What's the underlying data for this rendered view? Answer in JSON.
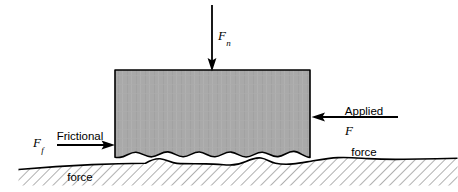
{
  "figure": {
    "name": "friction-force-diagram",
    "background_color": "#ffffff",
    "line_color": "#000000"
  },
  "block": {
    "name": "sliding-block",
    "fill_color": "#a9a9a9",
    "stroke_color": "#000000",
    "x": 115,
    "y": 70,
    "width": 195,
    "height": 88
  },
  "ground": {
    "name": "rough-ground-surface",
    "fill_color": "#ffffff",
    "hatch_color": "#6e6e6e",
    "stroke_color": "#000000",
    "left": 18,
    "right": 458,
    "bottom": 185
  },
  "forces": {
    "normal": {
      "label": "Fn",
      "symbol_base": "F",
      "symbol_sub": "n",
      "direction": "down",
      "arrow_x": 212,
      "arrow_y_start": 5,
      "arrow_y_end": 70
    },
    "applied": {
      "label_line1": "Applied",
      "label_line2": "force",
      "symbol_base": "F",
      "symbol_sub": "",
      "direction": "left",
      "arrow_y": 117,
      "arrow_x_start": 398,
      "arrow_x_end": 312
    },
    "frictional": {
      "label_line1": "Frictional",
      "label_line2": "force",
      "symbol_base": "F",
      "symbol_sub": "f",
      "direction": "right",
      "arrow_y": 145,
      "arrow_x_start": 57,
      "arrow_x_end": 114
    }
  }
}
